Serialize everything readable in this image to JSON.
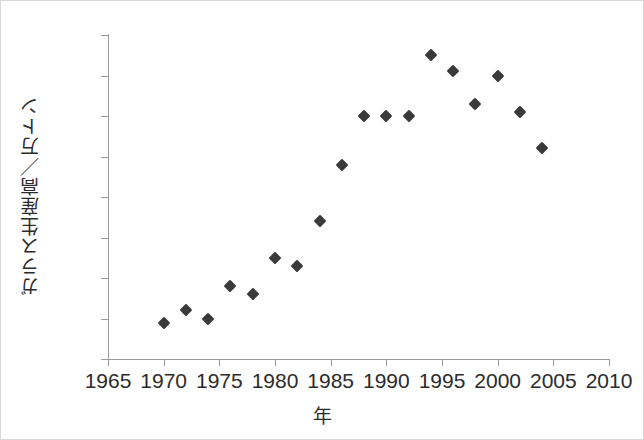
{
  "chart_data": {
    "type": "scatter",
    "title": "",
    "xlabel": "年",
    "ylabel": "ガラス生産高／万トン",
    "xlim": [
      1965,
      2010
    ],
    "ylim": [
      0,
      80
    ],
    "grid": false,
    "legend": null,
    "xticks": [
      1965,
      1970,
      1975,
      1980,
      1985,
      1990,
      1995,
      2000,
      2005,
      2010
    ],
    "ytick_positions": [
      80,
      70,
      60,
      50,
      40,
      30,
      20,
      10,
      0
    ],
    "ytick_labels": [
      "80",
      "70",
      "60",
      "50",
      "30",
      "20",
      "40",
      "10",
      "0"
    ],
    "marker": "diamond",
    "marker_color": "#3a3a3a",
    "axis_color": "#9a9a9a",
    "background_color": "#ffffff",
    "x": [
      1970,
      1972,
      1974,
      1976,
      1978,
      1980,
      1982,
      1984,
      1986,
      1988,
      1990,
      1992,
      1994,
      1996,
      1998,
      2000,
      2002,
      2004
    ],
    "values": [
      9,
      12,
      10,
      18,
      16,
      25,
      23,
      34,
      48,
      60,
      60,
      60,
      75,
      71,
      63,
      70,
      61,
      52
    ],
    "points": [
      {
        "x": 1970,
        "y": 9
      },
      {
        "x": 1972,
        "y": 12
      },
      {
        "x": 1974,
        "y": 10
      },
      {
        "x": 1976,
        "y": 18
      },
      {
        "x": 1978,
        "y": 16
      },
      {
        "x": 1980,
        "y": 25
      },
      {
        "x": 1982,
        "y": 23
      },
      {
        "x": 1984,
        "y": 34
      },
      {
        "x": 1986,
        "y": 48
      },
      {
        "x": 1988,
        "y": 60
      },
      {
        "x": 1990,
        "y": 60
      },
      {
        "x": 1992,
        "y": 60
      },
      {
        "x": 1994,
        "y": 75
      },
      {
        "x": 1996,
        "y": 71
      },
      {
        "x": 1998,
        "y": 63
      },
      {
        "x": 2000,
        "y": 70
      },
      {
        "x": 2002,
        "y": 61
      },
      {
        "x": 2004,
        "y": 52
      }
    ]
  }
}
